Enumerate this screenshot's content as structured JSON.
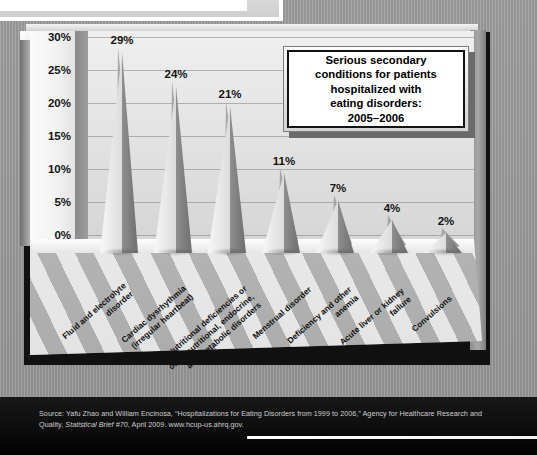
{
  "title_box": {
    "lines": [
      "Serious secondary",
      "conditions for patients",
      "hospitalized with",
      "eating disorders:",
      "2005–2006"
    ],
    "text": "Serious secondary conditions for patients hospitalized with eating disorders: 2005–2006"
  },
  "source": {
    "prefix": "Source: Yafu Zhao and William Encinosa, “Hospitalizations for Eating Disorders from 1999 to 2006,” Agency for Healthcare Research and Quality, ",
    "italic": "Statistical Brief #70",
    "suffix": ", April 2009. www.hcup-us.ahrq.gov."
  },
  "chart_data": {
    "type": "bar",
    "xlabel": "",
    "ylabel": "",
    "ylim": [
      0,
      32
    ],
    "yticks": [
      "0%",
      "5%",
      "10%",
      "15%",
      "20%",
      "25%",
      "30%"
    ],
    "ytick_values": [
      0,
      5,
      10,
      15,
      20,
      25,
      30
    ],
    "grid": true,
    "legend": "none",
    "categories": [
      "Fluid and electrolyte disorder",
      "Cardiac dysrhythmia (irregular heartbeat)",
      "Nutritional deficiencies or other nutritional, endocrine, and metabolic disorders",
      "Menstrual disorder",
      "Deficiency and other anemia",
      "Acute liver or kidney failure",
      "Convulsions"
    ],
    "category_lines": [
      [
        "Fluid and electrolyte",
        "disorder"
      ],
      [
        "Cardiac dysrhythmia",
        "(irregular heartbeat)"
      ],
      [
        "Nutritional deficiencies or",
        "other nutritional, endocrine,",
        "and metabolic disorders"
      ],
      [
        "Menstrual disorder"
      ],
      [
        "Deficiency and other",
        "anemia"
      ],
      [
        "Acute liver or kidney",
        "failure"
      ],
      [
        "Convulsions"
      ]
    ],
    "values": [
      29,
      24,
      21,
      11,
      7,
      4,
      2
    ],
    "value_labels": [
      "29%",
      "24%",
      "21%",
      "11%",
      "7%",
      "4%",
      "2%"
    ]
  },
  "colors": {
    "background": "#9a9a9a",
    "plot_wall": "#e4e4e4",
    "bar_light": "#f7f7f7",
    "bar_dark": "#6f6f6f",
    "footer": "#0d0d0d",
    "title_text": "#000000"
  }
}
